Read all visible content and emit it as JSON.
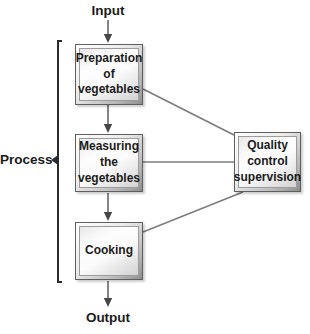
{
  "colors": {
    "connector_line": "#7d7d7d",
    "arrow_stem": "#6f6f6f",
    "arrow_head": "#474747",
    "bracket": "#2b2b2b",
    "text": "#1b1b1b",
    "box_border": "#5f5f5f",
    "box_fill_light": "#fdfdfd",
    "box_fill_dark": "#8e8e8e",
    "background": "#ffffff"
  },
  "labels": {
    "input": "Input",
    "output": "Output",
    "process": "Process"
  },
  "boxes": {
    "preparation": {
      "label": "Preparation\nof\nvegetables"
    },
    "measuring": {
      "label": "Measuring\nthe\nvegetables"
    },
    "cooking": {
      "label": "Cooking"
    },
    "quality": {
      "label": "Quality\ncontrol\nsupervision"
    }
  },
  "edges": [
    {
      "from": "input",
      "to": "preparation",
      "type": "arrow"
    },
    {
      "from": "preparation",
      "to": "measuring",
      "type": "arrow"
    },
    {
      "from": "measuring",
      "to": "cooking",
      "type": "arrow"
    },
    {
      "from": "cooking",
      "to": "output",
      "type": "arrow"
    },
    {
      "from": "preparation",
      "to": "quality",
      "type": "line"
    },
    {
      "from": "measuring",
      "to": "quality",
      "type": "line"
    },
    {
      "from": "quality",
      "to": "cooking",
      "type": "line"
    }
  ],
  "bracket": {
    "label": "Process",
    "spans": [
      "preparation",
      "measuring",
      "cooking"
    ]
  }
}
